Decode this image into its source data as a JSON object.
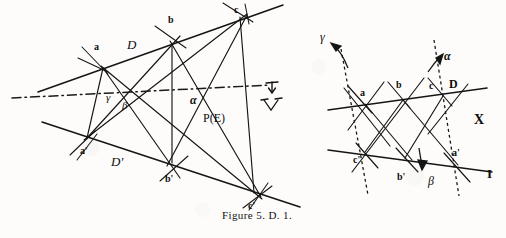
{
  "figure": {
    "caption": "Figure 5. D. 1.",
    "left_panel": {
      "name": "desargues-configuration-left",
      "line_labels": [
        {
          "id": "D",
          "text": "D",
          "x": 127,
          "y": 38
        },
        {
          "id": "Dp",
          "text": "D'",
          "x": 111,
          "y": 155
        }
      ],
      "point_labels": [
        {
          "id": "a",
          "text": "a",
          "x": 94,
          "y": 42
        },
        {
          "id": "b",
          "text": "b",
          "x": 168,
          "y": 15
        },
        {
          "id": "c",
          "text": "c",
          "x": 234,
          "y": 5
        },
        {
          "id": "ap",
          "text": "a'",
          "x": 80,
          "y": 146
        },
        {
          "id": "bp",
          "text": "b'",
          "x": 165,
          "y": 174
        },
        {
          "id": "cp",
          "text": "c'",
          "x": 248,
          "y": 201
        }
      ],
      "greek_labels": [
        {
          "id": "gamma",
          "text": "γ",
          "x": 106,
          "y": 92
        },
        {
          "id": "beta",
          "text": "β",
          "x": 122,
          "y": 100
        },
        {
          "id": "alpha",
          "text": "α",
          "x": 190,
          "y": 94
        }
      ],
      "set_label": {
        "id": "PE",
        "text": "P(E)",
        "x": 203,
        "y": 112
      },
      "annotation_marks": [
        "down-arrow-tick",
        "v-mark"
      ]
    },
    "right_panel": {
      "name": "desargues-configuration-right",
      "line_labels": [
        {
          "id": "D",
          "text": "D",
          "x": 449,
          "y": 78
        },
        {
          "id": "I",
          "text": "I",
          "x": 487,
          "y": 167
        }
      ],
      "point_labels": [
        {
          "id": "a",
          "text": "a",
          "x": 360,
          "y": 88
        },
        {
          "id": "b",
          "text": "b",
          "x": 396,
          "y": 80
        },
        {
          "id": "c",
          "text": "c",
          "x": 429,
          "y": 81
        },
        {
          "id": "cp",
          "text": "c'",
          "x": 353,
          "y": 155
        },
        {
          "id": "bp",
          "text": "b'",
          "x": 397,
          "y": 172
        },
        {
          "id": "ap",
          "text": "a'",
          "x": 452,
          "y": 148
        }
      ],
      "greek_labels": [
        {
          "id": "gamma",
          "text": "γ",
          "x": 320,
          "y": 31
        },
        {
          "id": "alpha",
          "text": "α",
          "x": 444,
          "y": 50
        },
        {
          "id": "beta",
          "text": "β",
          "x": 428,
          "y": 175
        }
      ],
      "set_label": {
        "id": "X",
        "text": "X",
        "x": 474,
        "y": 113
      }
    },
    "colors": {
      "ink": "#151515",
      "background": "#fdfcfb",
      "dashed_ink": "#1a1a1a"
    }
  }
}
